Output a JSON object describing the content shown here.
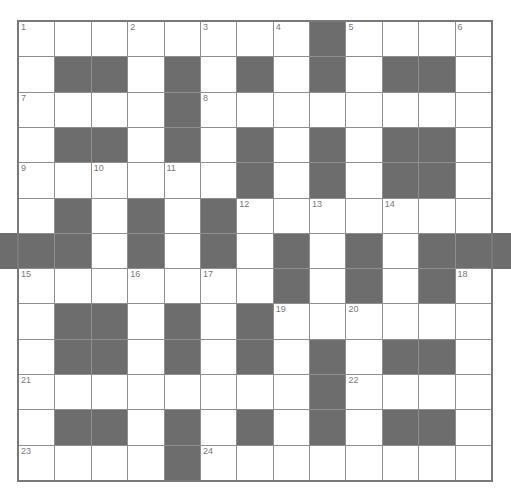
{
  "puzzle": {
    "rows": 13,
    "cols": 13,
    "colors": {
      "block": "#6d6d6d",
      "cell": "#ffffff",
      "line": "#8f8f8f",
      "number": "#7a7a7a"
    },
    "layout": [
      "WWWWWWWWBWWWW",
      "WBBWBWBWBWBBW",
      "WWWWBWWWWWWWW",
      "WBBWBWBWBWBBW",
      "WWWWWWBWBWBBW",
      "WBWBWBWWWWWWW",
      "BBWBWBWBWBWBB",
      "WWWWWWWBWBWBW",
      "WBBWBWBWWWWWW",
      "WBBWBWBWBWBBW",
      "WWWWWWWWBWWWW",
      "WBBWBWBWBWBBW",
      "WWWWBWWWWWWWW"
    ],
    "numbers": [
      {
        "r": 0,
        "c": 0,
        "n": "1"
      },
      {
        "r": 0,
        "c": 3,
        "n": "2"
      },
      {
        "r": 0,
        "c": 5,
        "n": "3"
      },
      {
        "r": 0,
        "c": 7,
        "n": "4"
      },
      {
        "r": 0,
        "c": 9,
        "n": "5"
      },
      {
        "r": 0,
        "c": 12,
        "n": "6"
      },
      {
        "r": 2,
        "c": 0,
        "n": "7"
      },
      {
        "r": 2,
        "c": 5,
        "n": "8"
      },
      {
        "r": 4,
        "c": 0,
        "n": "9"
      },
      {
        "r": 4,
        "c": 2,
        "n": "10"
      },
      {
        "r": 4,
        "c": 4,
        "n": "11"
      },
      {
        "r": 5,
        "c": 6,
        "n": "12"
      },
      {
        "r": 5,
        "c": 8,
        "n": "13"
      },
      {
        "r": 5,
        "c": 10,
        "n": "14"
      },
      {
        "r": 7,
        "c": 0,
        "n": "15"
      },
      {
        "r": 7,
        "c": 3,
        "n": "16"
      },
      {
        "r": 7,
        "c": 5,
        "n": "17"
      },
      {
        "r": 7,
        "c": 12,
        "n": "18"
      },
      {
        "r": 8,
        "c": 7,
        "n": "19"
      },
      {
        "r": 8,
        "c": 9,
        "n": "20"
      },
      {
        "r": 10,
        "c": 0,
        "n": "21"
      },
      {
        "r": 10,
        "c": 9,
        "n": "22"
      },
      {
        "r": 12,
        "c": 0,
        "n": "23"
      },
      {
        "r": 12,
        "c": 5,
        "n": "24"
      }
    ]
  }
}
